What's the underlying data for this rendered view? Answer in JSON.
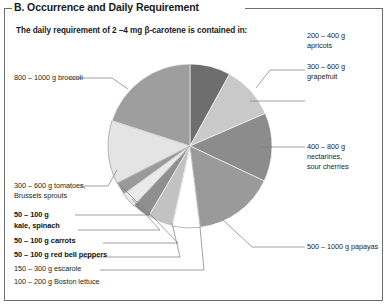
{
  "panel": {
    "title": "B. Occurrence and Daily Requirement",
    "subtitle": "The daily requirement of 2 –4 mg β-carotene is contained in:"
  },
  "chart_data": {
    "type": "pie",
    "unit": "g",
    "legend_position": "callout-labels",
    "categories": [
      "200 – 400 g apricots",
      "300 – 600 g grapefruit",
      "400 – 800 g nectarines, sour cherries",
      "500 – 1000 g papayas",
      "100 – 200 g Boston lettuce",
      "150 – 300 g escarole",
      "50 – 100 g red bell peppers",
      "50 – 100 g carrots",
      "50 – 100 g kale, spinach",
      "300 – 600 g tomatoes, Brussels sprouts",
      "800 – 1000 g broccoli"
    ],
    "values": [
      8.0,
      10.5,
      13.5,
      16.0,
      5.5,
      5.0,
      3.5,
      3.0,
      2.5,
      12.5,
      20.0
    ],
    "colors": [
      "#6e6e6e",
      "#c9c9c9",
      "#8c8c8c",
      "#9a9a9a",
      "#ffffff",
      "#c2c2c2",
      "#8f8f8f",
      "#eaeaea",
      "#9a9a9a",
      "#e4e4e4",
      "#9e9e9e"
    ],
    "start_angle_deg": 0,
    "xlabel": "",
    "ylabel": "",
    "grid": false
  },
  "labels": {
    "apricots": {
      "line1": "200 – 400 g",
      "line2": "apricots"
    },
    "grapefruit": {
      "line1": "300 – 600 g",
      "line2": "grapefruit"
    },
    "nectarines": {
      "line1": "400 – 800 g",
      "line2": "nectarines,",
      "line3": "sour cherries"
    },
    "papayas": {
      "line1": "500 – 1000 g papayas"
    },
    "broccoli": {
      "line1": "800 – 1000 g broccoli"
    },
    "tomatoes": {
      "line1": "300 – 600 g tomatoes,",
      "line2": "Brussels sprouts"
    },
    "kale": {
      "line1": "50 – 100 g",
      "line2": "kale, spinach"
    },
    "carrots": {
      "line1": "50 – 100 g carrots"
    },
    "peppers": {
      "line1": "50 – 100 g red bell peppers"
    },
    "escarole": {
      "line1": "150 – 300 g escarole"
    },
    "lettuce": {
      "line1": "100 – 200 g Boston lettuce"
    }
  }
}
